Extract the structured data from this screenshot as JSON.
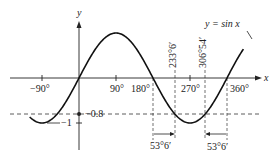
{
  "chart_data": {
    "type": "line",
    "title": "",
    "function_label": "y = sin x",
    "xlabel": "x",
    "ylabel": "y",
    "x_range_deg": [
      -120,
      400
    ],
    "y_range": [
      -1,
      1
    ],
    "grid": false,
    "x_ticks": [
      {
        "value": -90,
        "label": "−90°"
      },
      {
        "value": 90,
        "label": "90°"
      },
      {
        "value": 180,
        "label": "180°"
      },
      {
        "value": 270,
        "label": "270°"
      },
      {
        "value": 360,
        "label": "360°"
      }
    ],
    "y_ticks": [
      {
        "value": -0.8,
        "label": "−0.8"
      },
      {
        "value": -1,
        "label": "−1"
      }
    ],
    "series": [
      {
        "name": "y = sin x",
        "x_deg_start": -120,
        "x_deg_end": 400,
        "formula": "sin(x)"
      }
    ],
    "reference_line": {
      "y": -0.8,
      "style": "dashed"
    },
    "solutions": [
      {
        "value_deg": 233.1,
        "label": "233°6′"
      },
      {
        "value_deg": 306.9,
        "label": "306°54′"
      }
    ],
    "annotations": [
      {
        "from_deg": 180,
        "to_deg": 233.1,
        "label": "53°6′"
      },
      {
        "from_deg": 306.9,
        "to_deg": 360,
        "label": "53°6′"
      }
    ]
  },
  "labels": {
    "x_axis": "x",
    "y_axis": "y",
    "function": "y = sin x",
    "tick_m90": "−90°",
    "tick_90": "90°",
    "tick_180": "180°",
    "tick_270": "270°",
    "tick_360": "360°",
    "y_m08": "−0.8",
    "y_m1": "−1",
    "sol1": "233°6′",
    "sol2": "306°54′",
    "diff1": "53°6′",
    "diff2": "53°6′"
  }
}
